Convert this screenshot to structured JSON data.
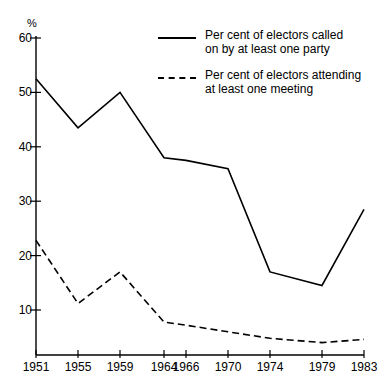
{
  "chart_data": {
    "type": "line",
    "title": "",
    "xlabel": "",
    "ylabel": "%",
    "unit_label": "%",
    "x": [
      "1951",
      "1955",
      "1959",
      "1964",
      "1966",
      "1970",
      "1974",
      "1979",
      "1983"
    ],
    "categories": [
      "1951",
      "1955",
      "1959",
      "1964",
      "1966",
      "1970",
      "1974",
      "1979",
      "1983"
    ],
    "ylim": [
      0,
      60
    ],
    "yticks": [
      10,
      20,
      30,
      40,
      50,
      60
    ],
    "ytick_labels": [
      "10",
      "20",
      "30",
      "40",
      "50",
      "60"
    ],
    "grid": false,
    "legend_position": "top-right",
    "series": [
      {
        "name": "Per cent of electors called\non by at least one party",
        "style": "solid",
        "color": "#000000",
        "values": [
          52.5,
          43.5,
          50.0,
          38.0,
          37.5,
          36.0,
          17.0,
          14.5,
          28.5
        ]
      },
      {
        "name": "Per cent of electors attending\nat least one meeting",
        "style": "dashed",
        "color": "#000000",
        "values": [
          22.8,
          11.2,
          17.0,
          7.8,
          7.2,
          6.0,
          4.8,
          4.0,
          4.6
        ]
      }
    ]
  },
  "axes": {
    "y_unit": "%",
    "y_tick_labels": [
      "60",
      "50",
      "40",
      "30",
      "20",
      "10"
    ],
    "x_tick_labels": [
      "1951",
      "1955",
      "1959",
      "1964",
      "1966",
      "1970",
      "1974",
      "1979",
      "1983"
    ]
  },
  "legend": {
    "items": [
      {
        "style": "solid",
        "line1": "Per cent of electors called",
        "line2": "on by at least one party",
        "label": "Per cent of electors called\non by at least one party"
      },
      {
        "style": "dashed",
        "line1": "Per cent of electors attending",
        "line2": "at least one meeting",
        "label": "Per cent of electors attending\nat least one meeting"
      }
    ]
  },
  "colors": {
    "line": "#000000",
    "axis": "#000000",
    "background": "#ffffff"
  }
}
